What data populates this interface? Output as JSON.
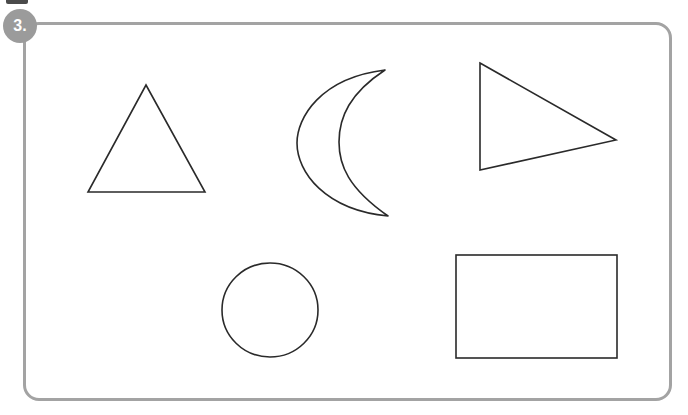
{
  "panel": {
    "step_badge_label": "3.",
    "badge_color": "#9b9b9b",
    "badge_text_color": "#ffffff",
    "frame_border_color": "#a3a3a3",
    "frame_border_width": "3px",
    "frame_corner_radius": "16px",
    "background_color": "#ffffff",
    "shape_stroke_color": "#2a2a2a",
    "shape_fill": "none",
    "shape_stroke_width": "1.6"
  },
  "top_marker": {
    "name": "clipped-bar",
    "color": "#3c3c3c"
  },
  "shapes": [
    {
      "id": "triangle",
      "icon": "triangle-icon",
      "label": "Triangle",
      "row": 1,
      "column": 1,
      "geometry": {
        "type": "polygon",
        "points": "146,85 205,192 88,192"
      }
    },
    {
      "id": "crescent-moon",
      "icon": "crescent-moon-icon",
      "label": "Crescent Moon",
      "row": 1,
      "column": 2,
      "geometry": {
        "type": "path",
        "d": "M 385,70 C 320,78 297,118 297,143 C 297,172 325,210 388,216 C 348,188 339,165 339,142 C 339,117 350,93 385,70 Z"
      }
    },
    {
      "id": "right-triangle-pointer",
      "icon": "play-triangle-icon",
      "label": "Right-Pointing Triangle",
      "row": 1,
      "column": 3,
      "geometry": {
        "type": "polygon",
        "points": "480,63 616,140 480,170"
      }
    },
    {
      "id": "circle",
      "icon": "circle-icon",
      "label": "Circle",
      "row": 2,
      "column": 1,
      "geometry": {
        "type": "ellipse",
        "cx": 270,
        "cy": 310,
        "rx": 48,
        "ry": 47
      }
    },
    {
      "id": "rectangle",
      "icon": "rectangle-icon",
      "label": "Rectangle",
      "row": 2,
      "column": 2,
      "geometry": {
        "type": "rect",
        "x": 456,
        "y": 255,
        "width": 161,
        "height": 103
      }
    }
  ]
}
